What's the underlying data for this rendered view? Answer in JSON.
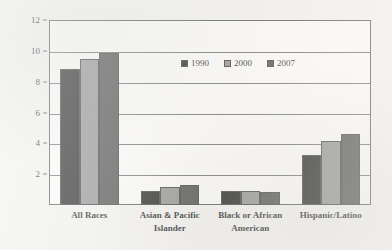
{
  "chart_data": {
    "type": "bar",
    "title": "",
    "xlabel": "",
    "ylabel": "millions of people",
    "ylim": [
      0,
      12
    ],
    "ytick_step": 2,
    "yticks": [
      0,
      2,
      4,
      6,
      8,
      10,
      12
    ],
    "ytick_labels": [
      "",
      "2",
      "4",
      "6",
      "8",
      "10",
      "12"
    ],
    "grid": true,
    "grid_axis": "y",
    "legend_position": "upper center inside",
    "categories": [
      "All Races",
      "Asian & Pacific Islander",
      "Black or African American",
      "Hispanic/Latino"
    ],
    "category_lines": [
      [
        "All Races"
      ],
      [
        "Asian & Pacific",
        "Islander"
      ],
      [
        "Black or African",
        "American"
      ],
      [
        "Hispanic/Latino"
      ]
    ],
    "series": [
      {
        "name": "1990",
        "color": "#1c1c1c",
        "values": [
          8.8,
          0.9,
          0.9,
          3.25
        ]
      },
      {
        "name": "2000",
        "color": "#8e8e8e",
        "values": [
          9.5,
          1.15,
          0.88,
          4.15
        ]
      },
      {
        "name": "2007",
        "color": "#4a4a4a",
        "values": [
          9.85,
          1.3,
          0.82,
          4.6
        ]
      }
    ]
  },
  "colors": {
    "paper_background": "#f2f1ee",
    "plot_background": "#fbfaf8",
    "axis_line": "#555555",
    "gridline": "#6d6d6d",
    "text": "#1f1f1f"
  }
}
